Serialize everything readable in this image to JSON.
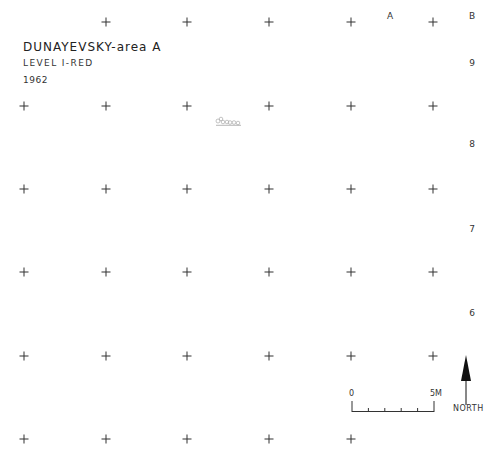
{
  "header": {
    "title": "DUNAYEVSKY-area A",
    "level": "LEVEL I-RED",
    "year": "1962"
  },
  "grid_labels": {
    "columns": [
      {
        "label": "A",
        "x": 390,
        "y": 16
      },
      {
        "label": "B",
        "x": 472,
        "y": 16
      }
    ],
    "rows": [
      {
        "label": "9",
        "x": 472,
        "y": 63
      },
      {
        "label": "8",
        "x": 472,
        "y": 144
      },
      {
        "label": "7",
        "x": 472,
        "y": 229
      },
      {
        "label": "6",
        "x": 472,
        "y": 313
      }
    ]
  },
  "grid_points": {
    "xs": [
      24,
      106,
      187,
      269,
      351,
      433
    ],
    "ys": [
      22,
      106,
      189,
      272,
      356,
      439
    ]
  },
  "scale": {
    "start_label": "0",
    "end_label": "5M"
  },
  "north": {
    "label": "NORTH"
  },
  "feature": {
    "name": "stone-cluster"
  }
}
